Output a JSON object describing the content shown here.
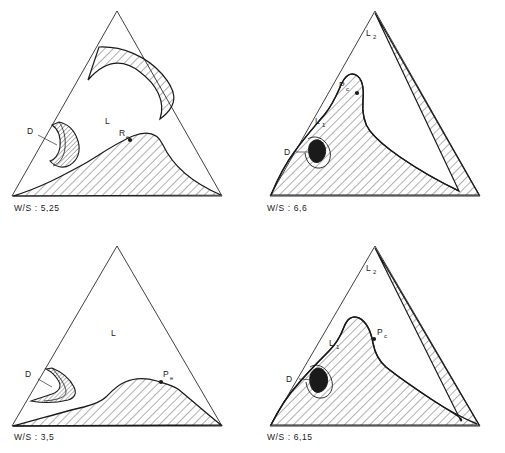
{
  "figure": {
    "type": "ternary-phase-diagram-grid",
    "panel_count": 4,
    "line_color": "#1a1a1a",
    "hatch_color": "#2a2a2a",
    "background": "#ffffff"
  },
  "panels": [
    {
      "id": "top-left",
      "caption": "W/S : 5,25",
      "ws_ratio": "5,25",
      "labels": {
        "liquid": "L",
        "d_region": "D",
        "plait_point": "R",
        "plait_point_sub": "e"
      },
      "regions": [
        "upper-lens-band",
        "lower-dome",
        "d-lens"
      ]
    },
    {
      "id": "top-right",
      "caption": "W/S : 6,6",
      "ws_ratio": "6,6",
      "labels": {
        "liquid_upper": "L",
        "liquid_upper_sub": "2",
        "liquid_lower": "L",
        "liquid_lower_sub": "1",
        "d_region": "D",
        "plait_point": "P",
        "plait_point_sub": "c"
      },
      "regions": [
        "large-hatched-band",
        "d-lens"
      ]
    },
    {
      "id": "bottom-left",
      "caption": "W/S : 3,5",
      "ws_ratio": "3,5",
      "labels": {
        "liquid": "L",
        "d_region": "D",
        "plait_point": "P",
        "plait_point_sub": "e"
      },
      "regions": [
        "lower-dome",
        "d-wedge"
      ]
    },
    {
      "id": "bottom-right",
      "caption": "W/S : 6,15",
      "ws_ratio": "6,15",
      "labels": {
        "liquid_upper": "L",
        "liquid_upper_sub": "2",
        "liquid_lower": "L",
        "liquid_lower_sub": "1",
        "d_region": "D",
        "plait_point": "P",
        "plait_point_sub": "c"
      },
      "regions": [
        "large-hatched-band",
        "d-lens"
      ]
    }
  ]
}
